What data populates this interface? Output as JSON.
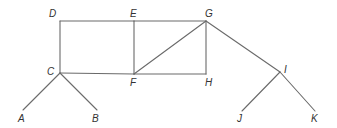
{
  "diagram": {
    "type": "graph",
    "colors": {
      "line": "#6a6a6a",
      "label": "#333333",
      "background": "#ffffff"
    },
    "nodes": [
      {
        "id": "A",
        "label": "A",
        "x": 23,
        "y": 110,
        "lx": 18,
        "ly": 122
      },
      {
        "id": "B",
        "label": "B",
        "x": 97,
        "y": 110,
        "lx": 92,
        "ly": 122
      },
      {
        "id": "C",
        "label": "C",
        "x": 60,
        "y": 73,
        "lx": 47,
        "ly": 75
      },
      {
        "id": "D",
        "label": "D",
        "x": 60,
        "y": 21,
        "lx": 49,
        "ly": 17
      },
      {
        "id": "E",
        "label": "E",
        "x": 134,
        "y": 21,
        "lx": 130,
        "ly": 17
      },
      {
        "id": "F",
        "label": "F",
        "x": 134,
        "y": 74,
        "lx": 130,
        "ly": 86
      },
      {
        "id": "G",
        "label": "G",
        "x": 206,
        "y": 21,
        "lx": 205,
        "ly": 17
      },
      {
        "id": "H",
        "label": "H",
        "x": 206,
        "y": 74,
        "lx": 205,
        "ly": 86
      },
      {
        "id": "I",
        "label": "I",
        "x": 280,
        "y": 72,
        "lx": 284,
        "ly": 73
      },
      {
        "id": "J",
        "label": "J",
        "x": 242,
        "y": 111,
        "lx": 237,
        "ly": 122
      },
      {
        "id": "K",
        "label": "K",
        "x": 315,
        "y": 111,
        "lx": 311,
        "ly": 122
      }
    ],
    "edges": [
      [
        "D",
        "E"
      ],
      [
        "E",
        "G"
      ],
      [
        "D",
        "C"
      ],
      [
        "C",
        "F"
      ],
      [
        "F",
        "H"
      ],
      [
        "E",
        "F"
      ],
      [
        "G",
        "H"
      ],
      [
        "F",
        "G"
      ],
      [
        "C",
        "A"
      ],
      [
        "C",
        "B"
      ],
      [
        "G",
        "I"
      ],
      [
        "I",
        "J"
      ],
      [
        "I",
        "K"
      ]
    ]
  }
}
